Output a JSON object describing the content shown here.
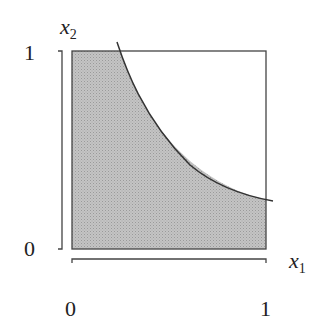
{
  "diagram": {
    "axes": {
      "x": {
        "label": "x",
        "subscript": "1",
        "ticks": [
          "0",
          "1"
        ]
      },
      "y": {
        "label": "x",
        "subscript": "2",
        "ticks": [
          "0",
          "1"
        ]
      }
    },
    "region": {
      "description": "Shaded region under a decreasing convex curve within the unit square",
      "fill": "#bdbdbd",
      "curve_color": "#333333",
      "box_color": "#444444"
    }
  }
}
